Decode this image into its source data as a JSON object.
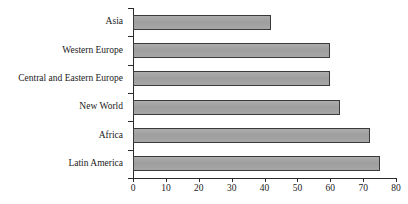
{
  "chart_data": {
    "type": "bar",
    "orientation": "horizontal",
    "title": "",
    "subtitle": "",
    "xlabel": "",
    "ylabel": "",
    "xlim": [
      0,
      80
    ],
    "ylim": null,
    "grid": false,
    "legend": null,
    "xticks": [
      0,
      10,
      20,
      30,
      40,
      50,
      60,
      70,
      80
    ],
    "xtick_labels": [
      "0",
      "10",
      "20",
      "30",
      "40",
      "50",
      "60",
      "70",
      "80"
    ],
    "categories": [
      "Asia",
      "Western Europe",
      "Central and Eastern Europe",
      "New World",
      "Africa",
      "Latin America"
    ],
    "values": [
      42,
      60,
      60,
      63,
      72,
      75
    ],
    "series": [
      {
        "name": "",
        "values": [
          42,
          60,
          60,
          63,
          72,
          75
        ]
      }
    ],
    "bar_fill_color": "#a3a3a3",
    "bar_border_color": "#3a3a3a",
    "axis_color": "#2b2b2b",
    "background_color": "#ffffff"
  }
}
